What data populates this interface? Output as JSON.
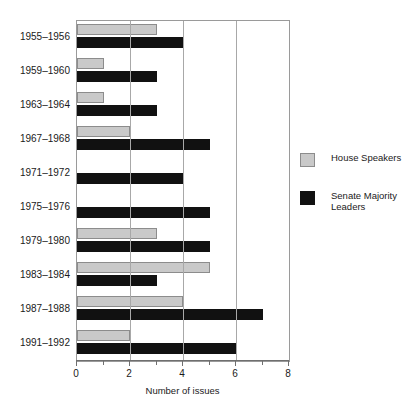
{
  "chart_data": {
    "type": "bar",
    "orientation": "horizontal",
    "title": "",
    "xlabel": "Number of issues",
    "ylabel": "",
    "xlim": [
      0,
      8
    ],
    "xticks": [
      0,
      2,
      4,
      6,
      8
    ],
    "xtick_labels": [
      "0",
      "2",
      "4",
      "6",
      "8"
    ],
    "xminor_ticks": [
      1,
      3,
      5,
      7
    ],
    "grid": "vertical gridlines at 2, 4, 6",
    "legend_position": "right",
    "categories": [
      "1955–1956",
      "1959–1960",
      "1963–1964",
      "1967–1968",
      "1971–1972",
      "1975–1976",
      "1979–1980",
      "1983–1984",
      "1987–1988",
      "1991–1992"
    ],
    "series": [
      {
        "name": "House Speakers",
        "color": "#c9c9c9",
        "values": [
          3,
          1,
          1,
          2,
          0,
          0,
          3,
          5,
          4,
          2
        ]
      },
      {
        "name": "Senate Majority Leaders",
        "color": "#111111",
        "values": [
          4,
          3,
          3,
          5,
          4,
          5,
          5,
          3,
          7,
          6
        ]
      }
    ]
  },
  "legend": {
    "items": [
      {
        "label": "House Speakers",
        "swatch": "house"
      },
      {
        "label": "Senate Majority Leaders",
        "swatch": "senate"
      }
    ]
  },
  "axis": {
    "x_title": "Number of issues"
  }
}
